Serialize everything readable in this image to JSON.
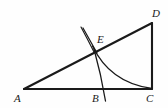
{
  "figure": {
    "type": "geometry-diagram",
    "background_color": "#fefefe",
    "stroke_color": "#1a1a1a",
    "canvas": {
      "width": 168,
      "height": 108
    },
    "points": [
      {
        "id": "A",
        "label": "A",
        "x": 24,
        "y": 89,
        "label_x": 14,
        "label_y": 93
      },
      {
        "id": "B",
        "label": "B",
        "x": 104,
        "y": 89,
        "label_x": 92,
        "label_y": 93
      },
      {
        "id": "C",
        "label": "C",
        "x": 152,
        "y": 89,
        "label_x": 146,
        "label_y": 93
      },
      {
        "id": "D",
        "label": "D",
        "x": 152,
        "y": 23,
        "label_x": 152,
        "label_y": 8
      },
      {
        "id": "E",
        "label": "E",
        "x": 95,
        "y": 50,
        "label_x": 97,
        "label_y": 34
      }
    ],
    "segments": [
      {
        "id": "AC",
        "from": "A",
        "to": "C",
        "x1": 24,
        "y1": 89,
        "x2": 152,
        "y2": 89,
        "width": 2.1
      },
      {
        "id": "CD",
        "from": "C",
        "to": "D",
        "x1": 152,
        "y1": 89,
        "x2": 152,
        "y2": 23,
        "width": 2.1
      },
      {
        "id": "AD",
        "from": "A",
        "to": "D",
        "x1": 24,
        "y1": 89,
        "x2": 152,
        "y2": 23,
        "width": 2.1
      },
      {
        "id": "EB-perpendicular",
        "from": "E",
        "to": "below-B",
        "x1": 94,
        "y1": 49,
        "x2": 106,
        "y2": 101,
        "width": 1.3
      },
      {
        "id": "construction-ray",
        "from": "upper-left",
        "to": "E",
        "x1": 83,
        "y1": 28,
        "x2": 97,
        "y2": 53,
        "width": 1.3
      }
    ],
    "arcs": [
      {
        "id": "arc-E-to-C",
        "path": "M 92 46 Q 112 78 150 88",
        "width": 1.3
      },
      {
        "id": "arc-tick-above-E",
        "path": "M 81 27 Q 88 40 94 52",
        "width": 1.2
      }
    ],
    "labels_font_style": "italic"
  }
}
